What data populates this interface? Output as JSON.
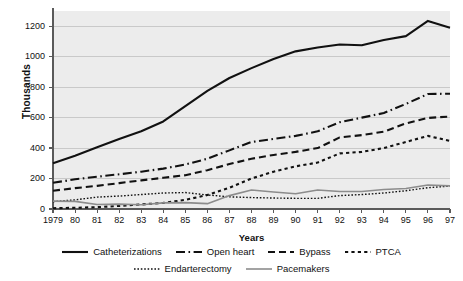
{
  "chart_data": {
    "type": "line",
    "title": "",
    "xlabel": "Years",
    "ylabel": "Thousands",
    "xlim": [
      1979,
      1997
    ],
    "ylim": [
      0,
      1300
    ],
    "yticks": [
      0,
      200,
      400,
      600,
      800,
      1000,
      1200
    ],
    "ytick_labels": [
      "0",
      "200",
      "400",
      "600",
      "800",
      "1000",
      "1200"
    ],
    "grid": "horizontal",
    "legend_position": "bottom",
    "x": [
      1979,
      1980,
      1981,
      1982,
      1983,
      1984,
      1985,
      1986,
      1987,
      1988,
      1989,
      1990,
      1991,
      1992,
      1993,
      1994,
      1995,
      1996,
      1997
    ],
    "xtick_labels": [
      "1979",
      "80",
      "81",
      "82",
      "83",
      "84",
      "85",
      "86",
      "87",
      "88",
      "89",
      "90",
      "91",
      "92",
      "93",
      "94",
      "95",
      "96",
      "97"
    ],
    "series": [
      {
        "name": "Catheterizations",
        "style": "solid",
        "color": "#111111",
        "width": 2.1,
        "values": [
          300,
          350,
          405,
          460,
          510,
          575,
          675,
          775,
          860,
          925,
          985,
          1035,
          1060,
          1080,
          1075,
          1110,
          1135,
          1235,
          1190
        ]
      },
      {
        "name": "Open heart",
        "style": "dash-dot",
        "color": "#111111",
        "width": 2.1,
        "values": [
          172,
          195,
          212,
          228,
          245,
          265,
          292,
          330,
          385,
          440,
          460,
          480,
          510,
          570,
          600,
          630,
          690,
          755,
          757
        ]
      },
      {
        "name": "Bypass",
        "style": "dashed",
        "color": "#111111",
        "width": 2.1,
        "values": [
          120,
          137,
          152,
          170,
          188,
          205,
          222,
          255,
          295,
          330,
          355,
          375,
          400,
          470,
          485,
          508,
          562,
          598,
          607
        ]
      },
      {
        "name": "PTCA",
        "style": "dotted-thick",
        "color": "#111111",
        "width": 2.1,
        "values": [
          5,
          8,
          12,
          20,
          30,
          40,
          60,
          92,
          140,
          200,
          245,
          280,
          305,
          365,
          375,
          400,
          440,
          480,
          447
        ]
      },
      {
        "name": "Endarterectomy",
        "style": "dotted-fine",
        "color": "#111111",
        "width": 1.4,
        "values": [
          48,
          60,
          78,
          85,
          95,
          105,
          108,
          92,
          80,
          75,
          72,
          70,
          70,
          88,
          95,
          105,
          120,
          140,
          150
        ]
      },
      {
        "name": "Pacemakers",
        "style": "solid-gray",
        "color": "#8c8c8c",
        "width": 1.6,
        "values": [
          52,
          50,
          30,
          32,
          28,
          40,
          42,
          35,
          88,
          125,
          112,
          100,
          125,
          115,
          115,
          128,
          135,
          158,
          152
        ]
      }
    ]
  },
  "axes": {
    "ylabel": "Thousands",
    "xlabel": "Years"
  },
  "legend": {
    "row1": [
      {
        "label": "Catheterizations",
        "style": "solid"
      },
      {
        "label": "Open heart",
        "style": "dash-dot"
      },
      {
        "label": "Bypass",
        "style": "dashed"
      },
      {
        "label": "PTCA",
        "style": "dotted-thick"
      }
    ],
    "row2": [
      {
        "label": "Endarterectomy",
        "style": "dotted-fine"
      },
      {
        "label": "Pacemakers",
        "style": "solid-gray"
      }
    ]
  },
  "colors": {
    "plot_background": "#ececec",
    "page_background": "#ffffff",
    "gridline": "#c9c9c9",
    "axis": "#5a5a5a",
    "ink": "#111111",
    "gray_series": "#8c8c8c"
  }
}
